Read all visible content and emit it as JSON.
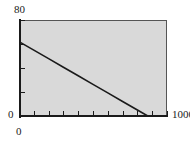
{
  "chart_data": {
    "type": "line",
    "title": "",
    "subtitle": "",
    "xlabel": "",
    "ylabel": "",
    "xlim": [
      0,
      1000
    ],
    "ylim": [
      0,
      80
    ],
    "grid": false,
    "legend": null,
    "background_color": "#d9d9d9",
    "line_color": "#1a1a1a",
    "axis_color": "#1a1a1a",
    "x_ticks": [
      0,
      100,
      200,
      300,
      400,
      500,
      600,
      700,
      800,
      900,
      1000
    ],
    "y_ticks": [
      0,
      20,
      40,
      60,
      80
    ],
    "x_tick_labels": [
      "0",
      "",
      "",
      "",
      "",
      "",
      "",
      "",
      "",
      "",
      "1000"
    ],
    "y_tick_labels": [
      "0",
      "",
      "",
      "",
      "80"
    ],
    "series": [
      {
        "name": "",
        "x": [
          0,
          100,
          200,
          300,
          400,
          500,
          600,
          700,
          800,
          870
        ],
        "y": [
          62,
          54.9,
          47.8,
          40.6,
          33.5,
          26.4,
          19.3,
          12.1,
          5.0,
          0
        ]
      }
    ]
  },
  "axes": {
    "y_max_label": "80",
    "y_min_label": "0",
    "x_min_label": "0",
    "x_max_label": "1000"
  }
}
